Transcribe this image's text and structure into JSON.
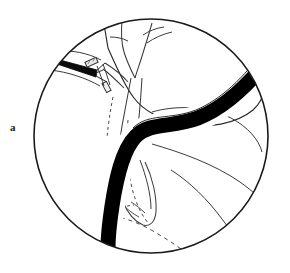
{
  "figure": {
    "panel_label": "a",
    "caption_text": "",
    "colors": {
      "background": "#ffffff",
      "outline": "#1a1a1a",
      "fill_solid": "#000000",
      "thin_line": "#3a3a3a",
      "instrument_metal": "#e8e8e8",
      "label_color": "#1a1a1a"
    },
    "viewport": {
      "width": 290,
      "height": 273,
      "circle_center_x": 151,
      "circle_center_y": 136,
      "circle_radius": 117,
      "circle_stroke_width": 1.6
    },
    "elements": [
      {
        "name": "field-of-view-circle",
        "kind": "circle",
        "description": "circular operative field border"
      },
      {
        "name": "liver-lobe-upper-right",
        "kind": "organ-outline",
        "description": "large rounded organ mass occupying upper right of field"
      },
      {
        "name": "hepatic-duct-branch",
        "kind": "duct-outline",
        "description": "Y shaped branching duct at top center"
      },
      {
        "name": "common-bile-duct",
        "kind": "duct-outline",
        "description": "vertical duct descending from branch point"
      },
      {
        "name": "cystic-duct-stump",
        "kind": "duct-outline",
        "description": "short duct segment with applied clip"
      },
      {
        "name": "solid-black-band",
        "kind": "solid-shape",
        "description": "thick black S-curved band running from right edge across field and down to lower left, rounded tip"
      },
      {
        "name": "clip-applier-instrument",
        "kind": "instrument",
        "description": "tapered black instrument entering from upper left"
      },
      {
        "name": "surgical-clip",
        "kind": "instrument",
        "description": "small rectangular metal clip at instrument tip"
      },
      {
        "name": "gallbladder-outline-dashed",
        "kind": "hidden-outline",
        "description": "dashed hidden contour of structure behind the black band"
      },
      {
        "name": "duodenum-contour",
        "kind": "organ-outline",
        "description": "thin curved contour lines in lower right quadrant"
      }
    ]
  }
}
